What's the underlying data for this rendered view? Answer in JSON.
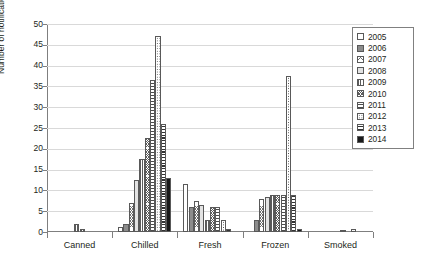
{
  "chart_data": {
    "type": "bar",
    "title": "",
    "xlabel": "",
    "ylabel": "Number of notifications",
    "ylim": [
      0,
      50
    ],
    "ytick_step": 5,
    "yticks": [
      "0",
      "5",
      "10",
      "15",
      "20",
      "25",
      "30",
      "35",
      "40",
      "45",
      "50"
    ],
    "grid": true,
    "legend_position": "top-right",
    "categories": [
      "Canned",
      "Chilled",
      "Fresh",
      "Frozen",
      "Smoked"
    ],
    "series": [
      {
        "name": "2005",
        "pattern": "empty-white",
        "values": [
          0,
          1.2,
          11.5,
          0,
          0
        ]
      },
      {
        "name": "2006",
        "pattern": "fine-dotted-gray",
        "values": [
          0,
          2,
          6,
          3,
          0
        ]
      },
      {
        "name": "2007",
        "pattern": "cross-hatch-light",
        "values": [
          0,
          7,
          7.5,
          8,
          0
        ]
      },
      {
        "name": "2008",
        "pattern": "solid-light-gray",
        "values": [
          0,
          12.5,
          6.5,
          8.5,
          0
        ]
      },
      {
        "name": "2009",
        "pattern": "vertical-lines",
        "values": [
          2,
          17.5,
          3,
          9,
          0
        ]
      },
      {
        "name": "2010",
        "pattern": "cross-hatch-dark",
        "values": [
          0.7,
          22.5,
          6,
          9,
          0.6
        ]
      },
      {
        "name": "2011",
        "pattern": "horizontal-lines",
        "values": [
          0,
          36.5,
          6,
          9,
          0
        ]
      },
      {
        "name": "2012",
        "pattern": "coarse-dotted",
        "values": [
          0,
          47,
          3,
          37.5,
          0.8
        ]
      },
      {
        "name": "2013",
        "pattern": "thick-horizontal",
        "values": [
          0,
          26,
          0.8,
          9,
          0
        ]
      },
      {
        "name": "2014",
        "pattern": "solid-black",
        "values": [
          0,
          13,
          0,
          0.8,
          0
        ]
      }
    ]
  },
  "legend": {
    "items": [
      {
        "label": "2005"
      },
      {
        "label": "2006"
      },
      {
        "label": "2007"
      },
      {
        "label": "2008"
      },
      {
        "label": "2009"
      },
      {
        "label": "2010"
      },
      {
        "label": "2011"
      },
      {
        "label": "2012"
      },
      {
        "label": "2013"
      },
      {
        "label": "2014"
      }
    ]
  },
  "colors": {
    "axis": "#7f7f7f",
    "grid": "#d9d9d9",
    "text": "#231f20",
    "plot_background": "#ffffff"
  }
}
